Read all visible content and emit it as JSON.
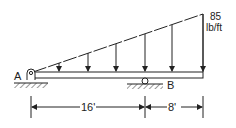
{
  "diagram": {
    "type": "beam-loading",
    "support_a_label": "A",
    "support_b_label": "B",
    "load_value": "85",
    "load_unit": "lb/ft",
    "dimensions": [
      {
        "label": "16'"
      },
      {
        "label": "8'"
      }
    ],
    "colors": {
      "ink": "#222222",
      "background": "#ffffff"
    }
  }
}
